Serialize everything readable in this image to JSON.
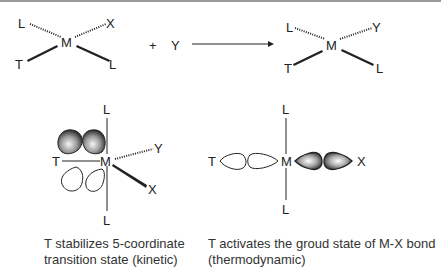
{
  "reaction": {
    "reactant": {
      "center": "M",
      "top_left": "L",
      "top_right": "X",
      "bottom_left": "T",
      "bottom_right": "L"
    },
    "plus": "+",
    "reagent": "Y",
    "product": {
      "center": "M",
      "top_left": "L",
      "top_right": "Y",
      "bottom_left": "T",
      "bottom_right": "L"
    }
  },
  "left_panel": {
    "center": "M",
    "top": "L",
    "bottom": "L",
    "left": "T",
    "right_upper": "Y",
    "right_lower": "X",
    "caption_line1": "T stabilizes 5-coordinate",
    "caption_line2": "transition state (kinetic)"
  },
  "right_panel": {
    "center": "M",
    "top": "L",
    "bottom": "L",
    "left": "T",
    "right": "X",
    "caption_line1": "T activates the groud state of M-X bond",
    "caption_line2": "(thermodynamic)"
  },
  "colors": {
    "line": "#222222",
    "border": "#9a9a9a",
    "lobe_fill_dark": "#333333",
    "lobe_fill_light": "#f0f0f0"
  }
}
